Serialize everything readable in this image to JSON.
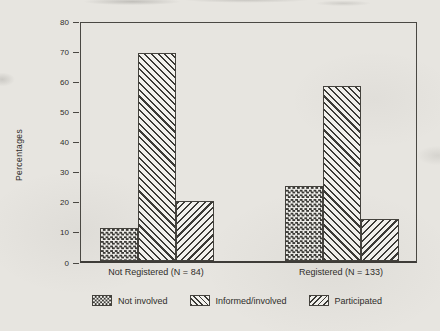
{
  "colors": {
    "ink": "#3b3a36",
    "paper": "#e7e5e0"
  },
  "chart_data": {
    "type": "bar",
    "title": "",
    "xlabel": "",
    "ylabel": "Percentages",
    "categories": [
      "Not Registered (N = 84)",
      "Registered (N = 133)"
    ],
    "series": [
      {
        "name": "Not involved",
        "pattern": "checkerboard",
        "values": [
          11,
          25
        ]
      },
      {
        "name": "Informed/involved",
        "pattern": "diagonal-backslash",
        "values": [
          69,
          58
        ]
      },
      {
        "name": "Participated",
        "pattern": "diagonal-slash",
        "values": [
          20,
          14
        ]
      }
    ],
    "ylim": [
      0,
      80
    ],
    "ytick_step": 10,
    "yticks": [
      0,
      10,
      20,
      30,
      40,
      50,
      60,
      70,
      80
    ],
    "grid": false,
    "legend_position": "bottom",
    "legend": [
      "Not involved",
      "Informed/involved",
      "Participated"
    ]
  }
}
